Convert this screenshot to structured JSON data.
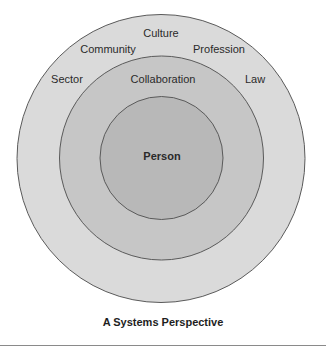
{
  "diagram": {
    "type": "concentric-circles",
    "caption": "A Systems Perspective",
    "rings": [
      {
        "name": "outer",
        "labels": [
          "Culture",
          "Community",
          "Profession",
          "Sector",
          "Law"
        ],
        "fill": "#dadada"
      },
      {
        "name": "middle",
        "labels": [
          "Collaboration"
        ],
        "fill": "#c6c6c6"
      },
      {
        "name": "inner",
        "labels": [
          "Person"
        ],
        "fill": "#b8b8b8"
      }
    ],
    "labels": {
      "culture": "Culture",
      "community": "Community",
      "profession": "Profession",
      "sector": "Sector",
      "law": "Law",
      "collaboration": "Collaboration",
      "person": "Person"
    },
    "colors": {
      "outer_fill": "#dadada",
      "middle_fill": "#c6c6c6",
      "inner_fill": "#b8b8b8",
      "stroke": "#5a5a5a"
    }
  }
}
